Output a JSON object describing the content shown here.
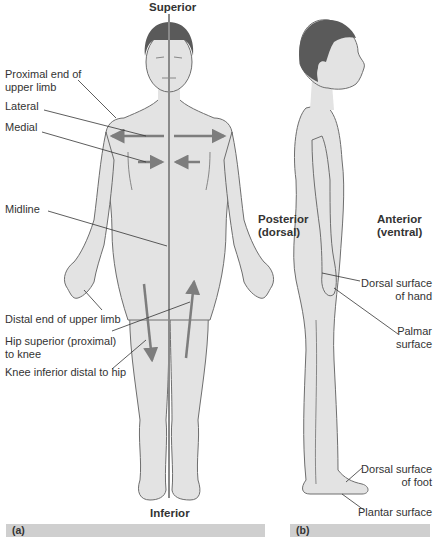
{
  "figure": {
    "panel_a": {
      "caption": "(a)",
      "view": "anterior",
      "top_label": "Superior",
      "bottom_label": "Inferior",
      "callouts": [
        {
          "id": "proximal-end-upper-limb",
          "text_lines": [
            "Proximal end of",
            "upper limb"
          ]
        },
        {
          "id": "lateral",
          "text_lines": [
            "Lateral"
          ]
        },
        {
          "id": "medial",
          "text_lines": [
            "Medial"
          ]
        },
        {
          "id": "midline",
          "text_lines": [
            "Midline"
          ]
        },
        {
          "id": "distal-end-upper-limb",
          "text_lines": [
            "Distal end of upper limb"
          ]
        },
        {
          "id": "hip-superior",
          "text_lines": [
            "Hip superior (proximal)",
            "to knee"
          ]
        },
        {
          "id": "knee-inferior",
          "text_lines": [
            "Knee inferior distal to hip"
          ]
        }
      ]
    },
    "panel_b": {
      "caption": "(b)",
      "view": "lateral",
      "posterior_label": [
        "Posterior",
        "(dorsal)"
      ],
      "anterior_label": [
        "Anterior",
        "(ventral)"
      ],
      "callouts": [
        {
          "id": "dorsal-surface-hand",
          "text_lines": [
            "Dorsal surface",
            "of hand"
          ]
        },
        {
          "id": "palmar-surface",
          "text_lines": [
            "Palmar",
            "surface"
          ]
        },
        {
          "id": "dorsal-surface-foot",
          "text_lines": [
            "Dorsal surface",
            "of foot"
          ]
        },
        {
          "id": "plantar-surface",
          "text_lines": [
            "Plantar surface"
          ]
        }
      ]
    },
    "colors": {
      "skin": "#e3e3e3",
      "hair": "#5a5a5a",
      "outline": "#6e6e6e",
      "arrow": "#7d7d7d",
      "caption_bar": "#cfcfcf"
    }
  }
}
